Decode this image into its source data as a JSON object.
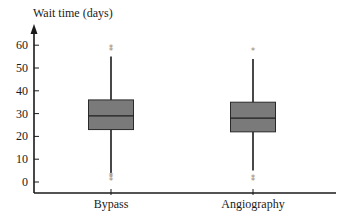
{
  "chart_data": {
    "type": "box",
    "title": "",
    "xlabel": "",
    "ylabel": "Wait time (days)",
    "ylim": [
      0,
      65
    ],
    "yticks": [
      0,
      10,
      20,
      30,
      40,
      50,
      60
    ],
    "grid": false,
    "legend": null,
    "categories": [
      "Bypass",
      "Angiography"
    ],
    "boxes": [
      {
        "name": "Bypass",
        "whisker_low": 4,
        "q1": 23,
        "median": 29,
        "q3": 36,
        "whisker_high": 55,
        "outliers_high": [
          58,
          59
        ],
        "outliers_low": [
          1,
          2,
          3
        ]
      },
      {
        "name": "Angiography",
        "whisker_low": 5,
        "q1": 22,
        "median": 28,
        "q3": 35,
        "whisker_high": 54,
        "outliers_high": [
          58
        ],
        "outliers_low": [
          1,
          2
        ]
      }
    ],
    "colors": {
      "box_fill": "#7a7a7a",
      "box_stroke": "#2a2a2a",
      "line": "#1a1a1a",
      "outlier": "#8a8a8a"
    }
  }
}
